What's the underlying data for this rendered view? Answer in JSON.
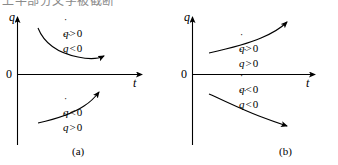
{
  "figure": {
    "top_cropped_text": "上半部分文字被截断",
    "axes": {
      "y_label": "q",
      "x_label": "t",
      "origin_label": "0"
    },
    "panels": [
      {
        "id": "a",
        "caption": "(a)",
        "curves": [
          {
            "name": "upper-curve",
            "region": "above-axis",
            "shape": "decreasing-convex",
            "arrow_direction": "right",
            "conditions": [
              {
                "var": "q",
                "dots": "˙",
                "op": ">",
                "value": "0"
              },
              {
                "var": "q",
                "dots": "˙˙",
                "op": "<",
                "value": "0"
              }
            ]
          },
          {
            "name": "lower-curve",
            "region": "below-axis",
            "shape": "increasing-concave",
            "arrow_direction": "upper-right",
            "conditions": [
              {
                "var": "q",
                "dots": "˙",
                "op": "<",
                "value": "0"
              },
              {
                "var": "q",
                "dots": "˙˙",
                "op": ">",
                "value": "0"
              }
            ]
          }
        ]
      },
      {
        "id": "b",
        "caption": "(b)",
        "curves": [
          {
            "name": "upper-curve",
            "region": "above-axis",
            "shape": "increasing-convex",
            "arrow_direction": "upper-right",
            "conditions": [
              {
                "var": "q",
                "dots": "˙",
                "op": ">",
                "value": "0"
              },
              {
                "var": "q",
                "dots": "˙˙",
                "op": ">",
                "value": "0"
              }
            ]
          },
          {
            "name": "lower-curve",
            "region": "below-axis",
            "shape": "decreasing-concave",
            "arrow_direction": "lower-right",
            "conditions": [
              {
                "var": "q",
                "dots": "˙",
                "op": "<",
                "value": "0"
              },
              {
                "var": "q",
                "dots": "˙˙",
                "op": "<",
                "value": "0"
              }
            ]
          }
        ]
      }
    ]
  },
  "panel_a": {
    "caption": "(a)",
    "y_label": "q",
    "x_label": "t",
    "origin": "0",
    "upper": {
      "l1_dots": "˙",
      "l1_var": "q",
      "l1_op": ">",
      "l1_val": "0",
      "l2_dots": "˙˙",
      "l2_var": "q",
      "l2_op": "<",
      "l2_val": "0"
    },
    "lower": {
      "l1_dots": "˙",
      "l1_var": "q",
      "l1_op": "<",
      "l1_val": "0",
      "l2_dots": "˙˙",
      "l2_var": "q",
      "l2_op": ">",
      "l2_val": "0"
    }
  },
  "panel_b": {
    "caption": "(b)",
    "y_label": "q",
    "x_label": "t",
    "origin": "0",
    "upper": {
      "l1_dots": "˙",
      "l1_var": "q",
      "l1_op": ">",
      "l1_val": "0",
      "l2_dots": "˙˙",
      "l2_var": "q",
      "l2_op": ">",
      "l2_val": "0"
    },
    "lower": {
      "l1_dots": "˙",
      "l1_var": "q",
      "l1_op": "<",
      "l1_val": "0",
      "l2_dots": "˙˙",
      "l2_var": "q",
      "l2_op": "<",
      "l2_val": "0"
    }
  },
  "colors": {
    "ink": "#000000",
    "background": "#ffffff",
    "faded_text": "#8a8a8a"
  }
}
